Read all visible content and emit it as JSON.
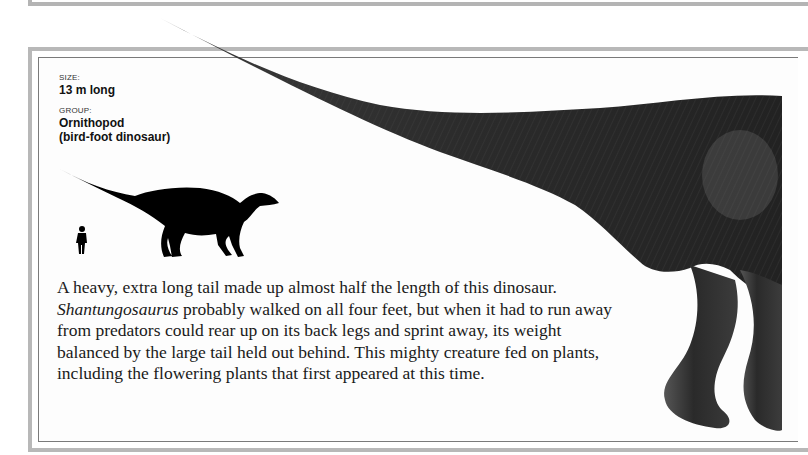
{
  "facts": {
    "size": {
      "label": "SIZE:",
      "value": "13 m long"
    },
    "group": {
      "label": "GROUP:",
      "value_line1": "Ornithopod",
      "value_line2": "(bird-foot dinosaur)"
    }
  },
  "scale_icons": {
    "human": "human-silhouette-icon",
    "dinosaur": "dinosaur-silhouette-icon"
  },
  "description": {
    "part1": "A heavy, extra long tail made up almost half the length of this dinosaur. ",
    "species": "Shantungosaurus",
    "part2": " probably walked on all four feet, but when it had to run away from predators could rear up on its back legs and sprint away, its weight balanced by the large tail held out behind. This mighty creature fed on plants, including the flowering plants that first appeared at this time."
  },
  "colors": {
    "frame_outer": "#b8b8b8",
    "frame_inner": "#7a7a7a",
    "text": "#1a1a1a",
    "illustration": "#2a2a2a"
  }
}
